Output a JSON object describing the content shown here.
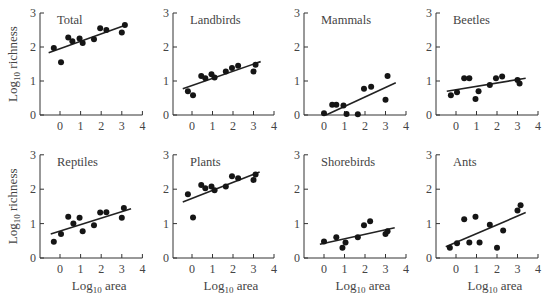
{
  "figure": {
    "ylabel": "Log10 richness",
    "xlabel": "Log10 area",
    "ink": "#333333",
    "label_color": "#444444"
  },
  "chart_data": [
    {
      "type": "scatter",
      "title": "Total",
      "xlabel": "",
      "ylabel": "Log10 richness",
      "xlim": [
        -0.7,
        4
      ],
      "ylim": [
        0,
        3
      ],
      "xticks": [
        0,
        1,
        2,
        3,
        4
      ],
      "yticks": [
        0,
        1,
        2,
        3
      ],
      "x": [
        -0.3,
        0.05,
        0.4,
        0.6,
        0.95,
        1.1,
        1.65,
        1.95,
        2.25,
        3.0,
        3.15
      ],
      "y": [
        1.97,
        1.55,
        2.28,
        2.17,
        2.25,
        2.12,
        2.23,
        2.55,
        2.5,
        2.43,
        2.65
      ],
      "fit_line": [
        [
          -0.55,
          1.83
        ],
        [
          3.2,
          2.65
        ]
      ]
    },
    {
      "type": "scatter",
      "title": "Landbirds",
      "xlabel": "",
      "ylabel": "",
      "xlim": [
        -0.7,
        4
      ],
      "ylim": [
        0,
        3
      ],
      "xticks": [
        0,
        1,
        2,
        3,
        4
      ],
      "yticks": [
        0,
        1,
        2,
        3
      ],
      "x": [
        -0.2,
        0.05,
        0.45,
        0.65,
        0.95,
        1.1,
        1.65,
        1.95,
        2.25,
        3.0,
        3.1
      ],
      "y": [
        0.7,
        0.58,
        1.15,
        1.08,
        1.2,
        1.1,
        1.28,
        1.38,
        1.45,
        1.28,
        1.48
      ],
      "fit_line": [
        [
          -0.45,
          0.77
        ],
        [
          3.35,
          1.57
        ]
      ]
    },
    {
      "type": "scatter",
      "title": "Mammals",
      "xlabel": "",
      "ylabel": "",
      "xlim": [
        -0.7,
        4
      ],
      "ylim": [
        0,
        3
      ],
      "xticks": [
        0,
        1,
        2,
        3,
        4
      ],
      "yticks": [
        0,
        1,
        2,
        3
      ],
      "x": [
        0,
        0.4,
        0.6,
        0.95,
        1.1,
        1.65,
        1.95,
        2.3,
        3.0,
        3.1
      ],
      "y": [
        0.05,
        0.3,
        0.3,
        0.28,
        0.03,
        0.02,
        0.77,
        0.83,
        0.45,
        1.15
      ],
      "fit_line": [
        [
          0.1,
          0
        ],
        [
          3.5,
          0.95
        ]
      ]
    },
    {
      "type": "scatter",
      "title": "Beetles",
      "xlabel": "",
      "ylabel": "",
      "xlim": [
        -0.7,
        4
      ],
      "ylim": [
        0,
        3
      ],
      "xticks": [
        0,
        1,
        2,
        3,
        4
      ],
      "yticks": [
        0,
        1,
        2,
        3
      ],
      "x": [
        -0.25,
        0.05,
        0.4,
        0.65,
        0.95,
        1.1,
        1.65,
        1.95,
        2.25,
        3.0,
        3.1
      ],
      "y": [
        0.58,
        0.67,
        1.08,
        1.08,
        0.47,
        0.7,
        0.88,
        1.08,
        1.13,
        1.03,
        0.93
      ],
      "fit_line": [
        [
          -0.45,
          0.7
        ],
        [
          3.4,
          1.08
        ]
      ]
    },
    {
      "type": "scatter",
      "title": "Reptiles",
      "xlabel": "Log10 area",
      "ylabel": "Log10 richness",
      "xlim": [
        -0.7,
        4
      ],
      "ylim": [
        0,
        3
      ],
      "xticks": [
        0,
        1,
        2,
        3,
        4
      ],
      "yticks": [
        0,
        1,
        2,
        3
      ],
      "x": [
        -0.3,
        0.05,
        0.4,
        0.65,
        0.95,
        1.1,
        1.65,
        1.95,
        2.25,
        3.0,
        3.1
      ],
      "y": [
        0.47,
        0.7,
        1.2,
        1.0,
        1.17,
        0.78,
        0.95,
        1.32,
        1.33,
        1.17,
        1.45
      ],
      "fit_line": [
        [
          -0.45,
          0.7
        ],
        [
          3.45,
          1.43
        ]
      ]
    },
    {
      "type": "scatter",
      "title": "Plants",
      "xlabel": "Log10 area",
      "ylabel": "",
      "xlim": [
        -0.7,
        4
      ],
      "ylim": [
        0,
        3
      ],
      "xticks": [
        0,
        1,
        2,
        3,
        4
      ],
      "yticks": [
        0,
        1,
        2,
        3
      ],
      "x": [
        -0.2,
        0.05,
        0.45,
        0.65,
        0.95,
        1.1,
        1.65,
        1.95,
        2.25,
        3.0,
        3.1
      ],
      "y": [
        1.85,
        1.18,
        2.12,
        2.03,
        2.08,
        1.97,
        2.08,
        2.38,
        2.32,
        2.27,
        2.43
      ],
      "fit_line": [
        [
          -0.45,
          1.63
        ],
        [
          3.3,
          2.5
        ]
      ]
    },
    {
      "type": "scatter",
      "title": "Shorebirds",
      "xlabel": "Log10 area",
      "ylabel": "",
      "xlim": [
        -0.7,
        4
      ],
      "ylim": [
        0,
        3
      ],
      "xticks": [
        0,
        1,
        2,
        3,
        4
      ],
      "yticks": [
        0,
        1,
        2,
        3
      ],
      "x": [
        0,
        0.6,
        0.9,
        1.05,
        1.65,
        1.95,
        2.25,
        3.0,
        3.1
      ],
      "y": [
        0.48,
        0.6,
        0.3,
        0.45,
        0.6,
        0.95,
        1.07,
        0.7,
        0.78
      ],
      "fit_line": [
        [
          -0.2,
          0.4
        ],
        [
          3.45,
          0.88
        ]
      ]
    },
    {
      "type": "scatter",
      "title": "Ants",
      "xlabel": "Log10 area",
      "ylabel": "",
      "xlim": [
        -0.7,
        4
      ],
      "ylim": [
        0,
        3
      ],
      "xticks": [
        0,
        1,
        2,
        3,
        4
      ],
      "yticks": [
        0,
        1,
        2,
        3
      ],
      "x": [
        -0.3,
        0.05,
        0.4,
        0.65,
        0.95,
        1.15,
        1.65,
        2.0,
        2.3,
        3.0,
        3.15
      ],
      "y": [
        0.3,
        0.43,
        1.13,
        0.45,
        1.2,
        0.45,
        0.97,
        0.3,
        0.8,
        1.38,
        1.53
      ],
      "fit_line": [
        [
          -0.5,
          0.33
        ],
        [
          3.4,
          1.32
        ]
      ]
    }
  ]
}
